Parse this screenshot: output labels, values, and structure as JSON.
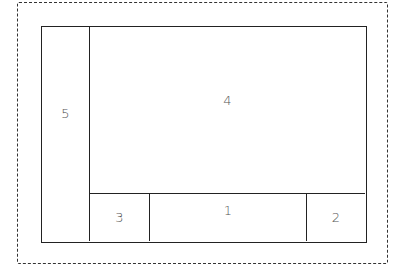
{
  "diagram": {
    "type": "layout-partition",
    "outer_border_style": "dashed",
    "regions": [
      {
        "id": "5",
        "label": "5",
        "position": "left column, full height"
      },
      {
        "id": "4",
        "label": "4",
        "position": "top-right, large area"
      },
      {
        "id": "3",
        "label": "3",
        "position": "bottom row, left"
      },
      {
        "id": "1",
        "label": "1",
        "position": "bottom row, center"
      },
      {
        "id": "2",
        "label": "2",
        "position": "bottom row, right"
      }
    ]
  },
  "colors": {
    "line": "#222222",
    "label": "#555555",
    "background": "#ffffff"
  }
}
